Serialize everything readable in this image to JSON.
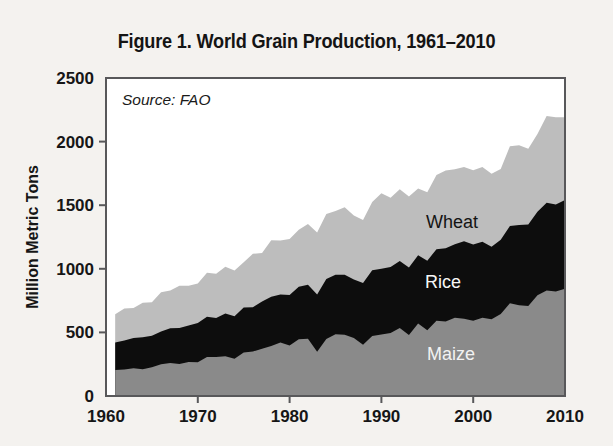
{
  "figure": {
    "title": "Figure 1. World Grain Production, 1961–2010",
    "source_note": "Source: FAO",
    "background_color": "#f4f2ef",
    "plot_background_color": "#ffffff",
    "frame_color": "#58585a"
  },
  "labels": {
    "wheat": "Wheat",
    "rice": "Rice",
    "maize": "Maize"
  },
  "chart_data": {
    "type": "area",
    "stacked": true,
    "title": "Figure 1. World Grain Production, 1961–2010",
    "subtitle": "",
    "xlabel": "",
    "ylabel": "Million Metric Tons",
    "annotations": [
      "Source: FAO"
    ],
    "legend_position": "inline-labels",
    "grid": false,
    "xlim": [
      1960,
      2010
    ],
    "ylim": [
      0,
      2500
    ],
    "xticks": [
      1960,
      1970,
      1980,
      1990,
      2000,
      2010
    ],
    "xticklabels": [
      "1960",
      "1970",
      "1980",
      "1990",
      "2000",
      "2010"
    ],
    "yticks": [
      0,
      500,
      1000,
      1500,
      2000,
      2500
    ],
    "yticklabels": [
      "0",
      "500",
      "1000",
      "1500",
      "2000",
      "2500"
    ],
    "colors": {
      "Maize": "#8a8a8a",
      "Rice": "#0d0d0d",
      "Wheat": "#bdbdbd"
    },
    "x": [
      1961,
      1962,
      1963,
      1964,
      1965,
      1966,
      1967,
      1968,
      1969,
      1970,
      1971,
      1972,
      1973,
      1974,
      1975,
      1976,
      1977,
      1978,
      1979,
      1980,
      1981,
      1982,
      1983,
      1984,
      1985,
      1986,
      1987,
      1988,
      1989,
      1990,
      1991,
      1992,
      1993,
      1994,
      1995,
      1996,
      1997,
      1998,
      1999,
      2000,
      2001,
      2002,
      2003,
      2004,
      2005,
      2006,
      2007,
      2008,
      2009,
      2010
    ],
    "series": [
      {
        "name": "Maize",
        "values": [
          205,
          208,
          219,
          210,
          227,
          249,
          259,
          252,
          267,
          266,
          307,
          307,
          313,
          293,
          342,
          349,
          372,
          394,
          421,
          397,
          447,
          450,
          347,
          449,
          486,
          481,
          456,
          403,
          471,
          483,
          496,
          534,
          479,
          570,
          517,
          592,
          586,
          615,
          608,
          592,
          615,
          604,
          645,
          729,
          714,
          707,
          792,
          830,
          821,
          844
        ]
      },
      {
        "name": "Rice",
        "values": [
          216,
          228,
          237,
          252,
          247,
          259,
          273,
          283,
          288,
          308,
          317,
          307,
          335,
          334,
          354,
          349,
          371,
          387,
          377,
          398,
          411,
          424,
          450,
          470,
          468,
          473,
          459,
          486,
          518,
          518,
          519,
          528,
          532,
          537,
          547,
          562,
          575,
          578,
          608,
          599,
          597,
          569,
          584,
          607,
          631,
          641,
          657,
          689,
          685,
          696
        ]
      },
      {
        "name": "Wheat",
        "values": [
          222,
          251,
          235,
          271,
          263,
          307,
          298,
          331,
          311,
          311,
          344,
          348,
          368,
          360,
          356,
          420,
          382,
          444,
          424,
          440,
          449,
          478,
          489,
          511,
          500,
          529,
          505,
          495,
          537,
          592,
          543,
          563,
          558,
          524,
          538,
          583,
          612,
          589,
          585,
          583,
          589,
          574,
          556,
          627,
          626,
          596,
          611,
          683,
          686,
          651
        ]
      }
    ],
    "totals": [
      643,
      687,
      691,
      733,
      737,
      815,
      830,
      866,
      866,
      885,
      968,
      962,
      1016,
      987,
      1052,
      1118,
      1125,
      1225,
      1222,
      1235,
      1307,
      1352,
      1286,
      1430,
      1454,
      1483,
      1420,
      1384,
      1526,
      1593,
      1558,
      1625,
      1569,
      1631,
      1602,
      1737,
      1773,
      1782,
      1801,
      1774,
      1801,
      1747,
      1785,
      1963,
      1971,
      1944,
      2060,
      2202,
      2192,
      2191
    ]
  }
}
